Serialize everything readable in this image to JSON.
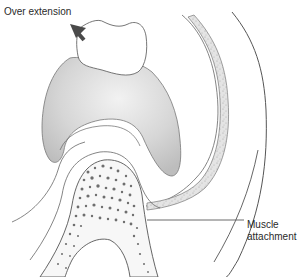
{
  "diagram": {
    "labels": {
      "over_extension": "Over extension",
      "muscle_line1": "Muscle",
      "muscle_line2": "attachment"
    },
    "colors": {
      "outline": "#555555",
      "denture_base_fill": "#cfcfcf",
      "tooth_fill": "#ffffff",
      "bone_dots": "#6e6e6e",
      "arrow": "#4a4a4a",
      "muscle_band": "#dcdcdc"
    }
  }
}
